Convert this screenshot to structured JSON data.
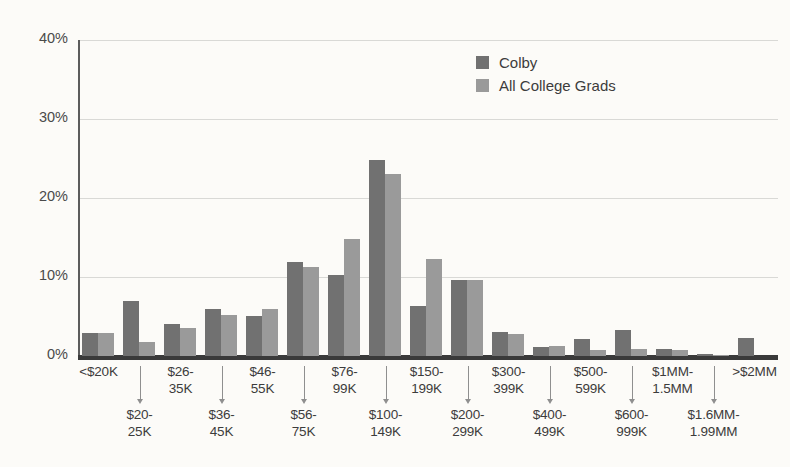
{
  "chart_data": {
    "type": "bar",
    "title": "",
    "subtitle": "",
    "xlabel": "",
    "ylabel": "",
    "ylim": [
      0,
      40
    ],
    "yticks": [
      0,
      10,
      20,
      30,
      40
    ],
    "ytick_labels": [
      "0%",
      "10%",
      "20%",
      "30%",
      "40%"
    ],
    "grid": true,
    "legend_position": "top-right",
    "categories": [
      "<$20K",
      "$20-\n25K",
      "$26-\n35K",
      "$36-\n45K",
      "$46-\n55K",
      "$56-\n75K",
      "$76-\n99K",
      "$100-\n149K",
      "$150-\n199K",
      "$200-\n299K",
      "$300-\n399K",
      "$400-\n499K",
      "$500-\n599K",
      "$600-\n999K",
      "$1MM-\n1.5MM",
      "$1.6MM-\n1.99MM",
      ">$2MM"
    ],
    "series": [
      {
        "name": "Colby",
        "color": "#717171",
        "values": [
          2.9,
          7.0,
          4.1,
          5.9,
          5.1,
          11.9,
          10.3,
          24.8,
          6.3,
          9.6,
          3.0,
          1.1,
          2.1,
          3.3,
          0.9,
          0.2,
          2.3
        ]
      },
      {
        "name": "All College Grads",
        "color": "#9a9a9a",
        "values": [
          2.9,
          1.8,
          3.6,
          5.2,
          6.0,
          11.3,
          14.8,
          23.1,
          12.3,
          9.6,
          2.8,
          1.3,
          0.8,
          0.9,
          0.7,
          0.15,
          0.0
        ]
      }
    ]
  },
  "legend": {
    "items": [
      {
        "label": "Colby",
        "color": "#717171"
      },
      {
        "label": "All College Grads",
        "color": "#9a9a9a"
      }
    ]
  },
  "axis": {
    "y_tick_labels": [
      "40%",
      "30%",
      "20%",
      "10%",
      "0%"
    ]
  },
  "colors": {
    "background": "#fcfbf8",
    "grid": "#d9d9d6",
    "axis": "#3a3a3a",
    "text": "#3c3c3c",
    "colby": "#717171",
    "all_college_grads": "#9a9a9a"
  }
}
